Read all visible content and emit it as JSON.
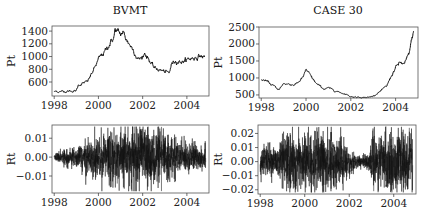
{
  "figure": {
    "panels": [
      {
        "id": "bvmt-price",
        "title": "BVMT",
        "ylabel": "Pt"
      },
      {
        "id": "case30-price",
        "title": "CASE 30",
        "ylabel": "Pt"
      },
      {
        "id": "bvmt-returns",
        "title": "",
        "ylabel": "Rt"
      },
      {
        "id": "case30-returns",
        "title": "",
        "ylabel": "Rt"
      }
    ]
  },
  "chart_data": [
    {
      "type": "line",
      "title": "BVMT",
      "xlabel": "",
      "ylabel": "Pt",
      "x_ticks": [
        1998,
        2000,
        2002,
        2004
      ],
      "y_ticks": [
        600,
        800,
        1000,
        1200,
        1400
      ],
      "xlim": [
        1997.9,
        2005.0
      ],
      "ylim": [
        380,
        1480
      ],
      "grid": false,
      "series": [
        {
          "name": "BVMT price",
          "x": [
            1998.0,
            1998.5,
            1999.0,
            1999.1,
            1999.5,
            1999.8,
            2000.0,
            2000.3,
            2000.5,
            2000.7,
            2000.75,
            2001.0,
            2001.1,
            2001.3,
            2001.6,
            2001.8,
            2002.0,
            2002.1,
            2002.3,
            2002.5,
            2002.8,
            2003.2,
            2003.3,
            2003.5,
            2003.8,
            2004.0,
            2004.3,
            2004.6,
            2004.8
          ],
          "values": [
            450,
            455,
            460,
            560,
            600,
            800,
            950,
            1080,
            1200,
            1300,
            1420,
            1340,
            1380,
            1250,
            1100,
            960,
            990,
            1060,
            950,
            820,
            790,
            730,
            880,
            940,
            920,
            950,
            980,
            1010,
            990
          ]
        }
      ]
    },
    {
      "type": "line",
      "title": "CASE 30",
      "xlabel": "",
      "ylabel": "Pt",
      "x_ticks": [
        1998,
        2000,
        2002,
        2004
      ],
      "y_ticks": [
        500,
        1000,
        1500,
        2000,
        2500
      ],
      "xlim": [
        1997.9,
        2005.0
      ],
      "ylim": [
        410,
        2500
      ],
      "grid": false,
      "series": [
        {
          "name": "CASE 30 price",
          "x": [
            1998.0,
            1998.2,
            1998.5,
            1998.7,
            1998.8,
            1999.0,
            1999.2,
            1999.5,
            1999.7,
            1999.9,
            2000.0,
            2000.2,
            2000.5,
            2000.8,
            2001.0,
            2001.5,
            2001.8,
            2002.0,
            2002.5,
            2002.8,
            2003.0,
            2003.3,
            2003.6,
            2003.8,
            2004.0,
            2004.2,
            2004.4,
            2004.6,
            2004.8
          ],
          "values": [
            950,
            920,
            780,
            700,
            650,
            840,
            820,
            800,
            900,
            1050,
            1250,
            1050,
            800,
            680,
            700,
            580,
            520,
            450,
            430,
            430,
            470,
            600,
            750,
            1050,
            1300,
            1450,
            1400,
            1700,
            2400
          ]
        }
      ]
    },
    {
      "type": "line",
      "title": "",
      "xlabel": "",
      "ylabel": "Rt",
      "x_ticks": [
        1998,
        2000,
        2002,
        2004
      ],
      "y_ticks": [
        -0.01,
        0.0,
        0.01
      ],
      "y_tick_labels": [
        "-0.01",
        "0.00",
        "0.01"
      ],
      "xlim": [
        1997.9,
        2005.0
      ],
      "ylim": [
        -0.019,
        0.017
      ],
      "grid": false,
      "series": [
        {
          "name": "BVMT returns",
          "x_range": [
            1998.0,
            2004.85
          ],
          "volatility_profile": {
            "1998.0": 0.0008,
            "1998.9": 0.002,
            "1999.5": 0.004,
            "2000.5": 0.006,
            "2001.5": 0.007,
            "2002.5": 0.006,
            "2003.5": 0.004,
            "2004.85": 0.0025
          },
          "notable_spikes": [
            {
              "x": 2002.85,
              "value": 0.016
            },
            {
              "x": 2002.85,
              "value": -0.018
            },
            {
              "x": 2000.85,
              "value": -0.014
            },
            {
              "x": 2001.75,
              "value": 0.015
            }
          ]
        }
      ]
    },
    {
      "type": "line",
      "title": "",
      "xlabel": "",
      "ylabel": "Rt",
      "x_ticks": [
        1998,
        2000,
        2002,
        2004
      ],
      "y_ticks": [
        -0.02,
        -0.01,
        0.0,
        0.01,
        0.02
      ],
      "y_tick_labels": [
        "-0.02",
        "-0.01",
        "0.00",
        "0.01",
        "0.02"
      ],
      "xlim": [
        1997.9,
        2005.0
      ],
      "ylim": [
        -0.023,
        0.026
      ],
      "grid": false,
      "series": [
        {
          "name": "CASE 30 returns",
          "x_range": [
            1998.0,
            2004.85
          ],
          "volatility_profile": {
            "1998.0": 0.005,
            "1998.8": 0.004,
            "1999.0": 0.008,
            "2001.0": 0.009,
            "2001.8": 0.006,
            "2002.3": 0.002,
            "2002.9": 0.002,
            "2003.1": 0.008,
            "2004.85": 0.008
          },
          "notable_spikes": [
            {
              "x": 2003.65,
              "value": 0.025
            },
            {
              "x": 2004.7,
              "value": 0.024
            },
            {
              "x": 2003.05,
              "value": 0.022
            },
            {
              "x": 2000.8,
              "value": -0.022
            },
            {
              "x": 2003.1,
              "value": -0.021
            }
          ]
        }
      ]
    }
  ]
}
